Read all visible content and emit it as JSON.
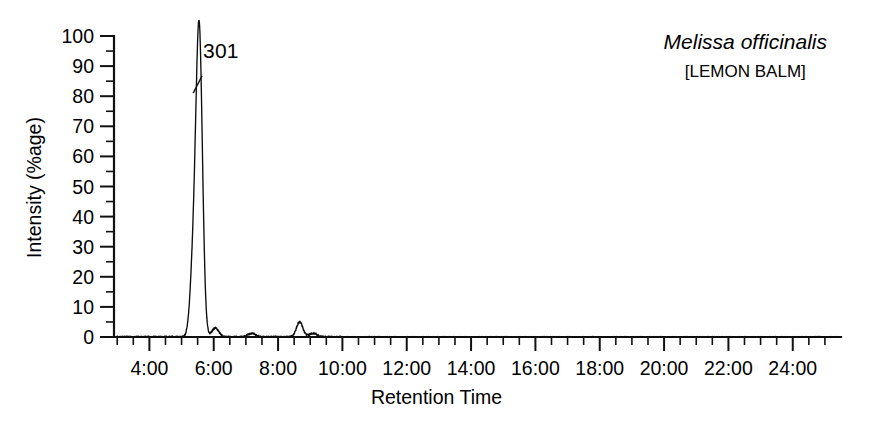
{
  "figure": {
    "species_name": "Melissa officinalis",
    "common_name": "[LEMON BALM]",
    "peak_label": "301"
  },
  "chart_data": {
    "type": "line",
    "title": "Melissa officinalis [LEMON BALM]",
    "xlabel": "Retention Time",
    "ylabel": "Intensity (%age)",
    "grid": false,
    "legend": "none",
    "annotations": [
      {
        "text": "301",
        "target_x_minutes": 5.55,
        "target_y": 100,
        "note": "leader line from label down-left to main peak"
      },
      {
        "text": "Melissa officinalis",
        "style": "italic",
        "position": "top-right"
      },
      {
        "text": "[LEMON BALM]",
        "style": "normal",
        "position": "top-right"
      }
    ],
    "xlim": [
      2.9,
      25.5
    ],
    "ylim": [
      0,
      100
    ],
    "x_tick_labels": [
      "4:00",
      "6:00",
      "8:00",
      "10:00",
      "12:00",
      "14:00",
      "16:00",
      "18:00",
      "20:00",
      "22:00",
      "24:00"
    ],
    "x_tick_values": [
      4,
      6,
      8,
      10,
      12,
      14,
      16,
      18,
      20,
      22,
      24
    ],
    "x_minor_tick_interval_minutes": 0.5,
    "y_tick_labels": [
      "0",
      "10",
      "20",
      "30",
      "40",
      "50",
      "60",
      "70",
      "80",
      "90",
      "100"
    ],
    "y_tick_values": [
      0,
      10,
      20,
      30,
      40,
      50,
      60,
      70,
      80,
      90,
      100
    ],
    "y_minor_tick_interval": 5,
    "peaks": [
      {
        "retention_time": "5:22",
        "x_minutes": 5.37,
        "height": 24,
        "width_minutes": 0.1,
        "label": ""
      },
      {
        "retention_time": "5:33",
        "x_minutes": 5.55,
        "height": 100,
        "width_minutes": 0.1,
        "label": "301"
      },
      {
        "retention_time": "6:03",
        "x_minutes": 6.05,
        "height": 3,
        "width_minutes": 0.11,
        "label": ""
      },
      {
        "retention_time": "8:40",
        "x_minutes": 8.67,
        "height": 5,
        "width_minutes": 0.1,
        "label": ""
      },
      {
        "retention_time": "7:10",
        "x_minutes": 7.18,
        "height": 1.2,
        "width_minutes": 0.12,
        "label": ""
      },
      {
        "retention_time": "9:05",
        "x_minutes": 9.1,
        "height": 1.3,
        "width_minutes": 0.12,
        "label": ""
      }
    ],
    "baseline_noise_amplitude": 0.6,
    "series": [
      {
        "name": "Total Ion Chromatogram",
        "note": "Intensity normalized to base peak at 5:33 = 100%"
      }
    ]
  }
}
